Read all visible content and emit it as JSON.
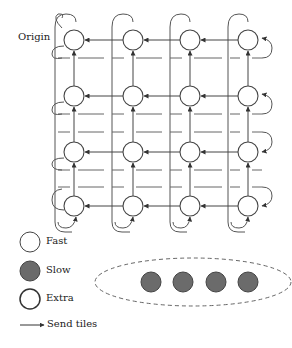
{
  "diagram": {
    "origin_label": "Origin",
    "grid": {
      "rows": 4,
      "cols": 4,
      "col_x": [
        74,
        133,
        190,
        248
      ],
      "row_y": [
        40,
        96,
        152,
        206
      ],
      "node_radius": 10,
      "node_type": "Fast"
    },
    "slow_group": {
      "node_count": 4,
      "node_type": "Slow",
      "enclosure": "dashed-ellipse"
    }
  },
  "legend": {
    "items": [
      {
        "label": "Fast",
        "shape": "circle-outline"
      },
      {
        "label": "Slow",
        "shape": "circle-filled"
      },
      {
        "label": "Extra",
        "shape": "circle-outline-thick"
      },
      {
        "label": "Send tiles",
        "shape": "arrow"
      }
    ]
  },
  "colors": {
    "stroke": "#555555",
    "slow_fill": "#6b6b6b",
    "text": "#222222"
  }
}
